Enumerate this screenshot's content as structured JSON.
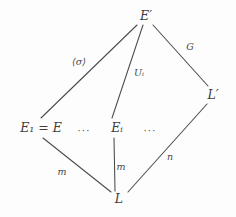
{
  "figure": {
    "kind": "mathematical-lattice-diagram",
    "title": "",
    "background_color": "#fdfdfd",
    "ink_color": "#3f3f3f"
  },
  "nodes": [
    {
      "id": "E-prime",
      "label": "E′",
      "x": 146,
      "y": 16,
      "name": "node-e-prime"
    },
    {
      "id": "L-prime",
      "label": "L′",
      "x": 213,
      "y": 95,
      "name": "node-l-prime"
    },
    {
      "id": "E1-eq-E",
      "label": "E₁ = E",
      "x": 41,
      "y": 128,
      "name": "node-e1-equals-e"
    },
    {
      "id": "Ei",
      "label": "Eᵢ",
      "x": 117,
      "y": 128,
      "name": "node-ei"
    },
    {
      "id": "L",
      "label": "L",
      "x": 119,
      "y": 199,
      "name": "node-l"
    }
  ],
  "ellipses": [
    {
      "id": "dots-left",
      "label": "···",
      "x": 84,
      "y": 131,
      "name": "ellipsis-between-e1-and-ei"
    },
    {
      "id": "dots-right",
      "label": "···",
      "x": 150,
      "y": 131,
      "name": "ellipsis-after-ei"
    }
  ],
  "edges": [
    {
      "id": "edge-sigma",
      "from": "E-prime",
      "to": "E1-eq-E",
      "label": "⟨σ⟩",
      "label_x": 79,
      "label_y": 62,
      "x1": 137,
      "y1": 25,
      "x2": 41,
      "y2": 118,
      "name": "edge-e-prime-to-e1"
    },
    {
      "id": "edge-Ui",
      "from": "E-prime",
      "to": "Ei",
      "label": "Uᵢ",
      "label_x": 139,
      "label_y": 73,
      "x1": 143,
      "y1": 25,
      "x2": 112,
      "y2": 118,
      "name": "edge-e-prime-to-ei"
    },
    {
      "id": "edge-G",
      "from": "E-prime",
      "to": "L-prime",
      "label": "G",
      "label_x": 190,
      "label_y": 47,
      "x1": 153,
      "y1": 25,
      "x2": 208,
      "y2": 86,
      "name": "edge-e-prime-to-l-prime"
    },
    {
      "id": "edge-m-left",
      "from": "E1-eq-E",
      "to": "L",
      "label": "m",
      "label_x": 62,
      "label_y": 172,
      "x1": 43,
      "y1": 138,
      "x2": 111,
      "y2": 192,
      "name": "edge-e1-to-l"
    },
    {
      "id": "edge-m-mid",
      "from": "Ei",
      "to": "L",
      "label": "m",
      "label_x": 121,
      "label_y": 167,
      "x1": 114,
      "y1": 138,
      "x2": 115,
      "y2": 191,
      "name": "edge-ei-to-l"
    },
    {
      "id": "edge-n",
      "from": "L-prime",
      "to": "L",
      "label": "n",
      "label_x": 170,
      "label_y": 157,
      "x1": 207,
      "y1": 104,
      "x2": 128,
      "y2": 192,
      "name": "edge-l-prime-to-l"
    }
  ]
}
